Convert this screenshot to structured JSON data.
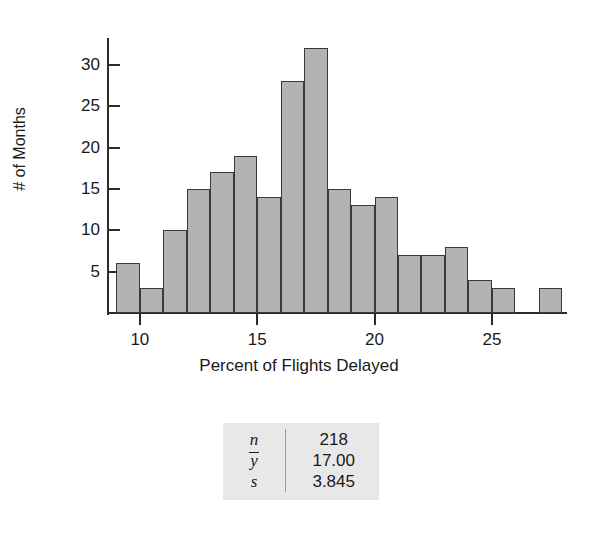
{
  "chart_data": {
    "type": "bar",
    "title": "",
    "xlabel": "Percent of Flights Delayed",
    "ylabel": "# of Months",
    "xlim": [
      8.6,
      28.2
    ],
    "ylim": [
      0,
      33
    ],
    "bin_width": 1,
    "grid": false,
    "legend": "none",
    "x_ticks": [
      10,
      15,
      20,
      25
    ],
    "y_ticks": [
      5,
      10,
      15,
      20,
      25,
      30
    ],
    "bins": [
      {
        "left": 9,
        "right": 10,
        "value": 6
      },
      {
        "left": 10,
        "right": 11,
        "value": 3
      },
      {
        "left": 11,
        "right": 12,
        "value": 10
      },
      {
        "left": 12,
        "right": 13,
        "value": 15
      },
      {
        "left": 13,
        "right": 14,
        "value": 17
      },
      {
        "left": 14,
        "right": 15,
        "value": 19
      },
      {
        "left": 15,
        "right": 16,
        "value": 14
      },
      {
        "left": 16,
        "right": 17,
        "value": 28
      },
      {
        "left": 17,
        "right": 18,
        "value": 32
      },
      {
        "left": 18,
        "right": 19,
        "value": 15
      },
      {
        "left": 19,
        "right": 20,
        "value": 13
      },
      {
        "left": 20,
        "right": 21,
        "value": 14
      },
      {
        "left": 21,
        "right": 22,
        "value": 7
      },
      {
        "left": 22,
        "right": 23,
        "value": 7
      },
      {
        "left": 23,
        "right": 24,
        "value": 8
      },
      {
        "left": 24,
        "right": 25,
        "value": 4
      },
      {
        "left": 25,
        "right": 26,
        "value": 3
      },
      {
        "left": 27,
        "right": 28,
        "value": 3
      }
    ],
    "bar_fill_color": "#b3b3b3",
    "bar_edge_color": "#3a3a3a"
  },
  "summary": {
    "rows": [
      {
        "symbol": "n",
        "overbar": false,
        "value": "218"
      },
      {
        "symbol": "y",
        "overbar": true,
        "value": "17.00"
      },
      {
        "symbol": "s",
        "overbar": false,
        "value": "3.845"
      }
    ],
    "background_color": "#e8e8e8"
  }
}
